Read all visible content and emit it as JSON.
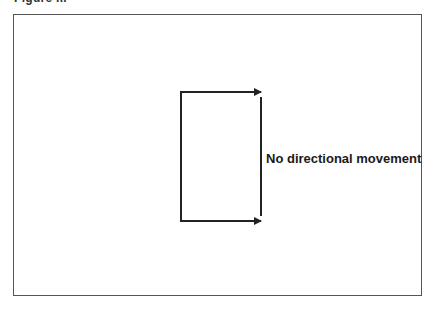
{
  "figure": {
    "caption_partial": "Figure ..."
  },
  "diagram": {
    "label": "No directional movement",
    "stroke_color": "#222222",
    "frame_color": "#555555",
    "shapes": [
      {
        "type": "line",
        "from": [
          181,
          92
        ],
        "to": [
          181,
          221
        ],
        "description": "left vertical segment"
      },
      {
        "type": "arrow",
        "from": [
          181,
          92
        ],
        "to": [
          261,
          92
        ],
        "description": "top arrow pointing right"
      },
      {
        "type": "arrow",
        "from": [
          181,
          221
        ],
        "to": [
          261,
          221
        ],
        "description": "bottom arrow pointing right"
      },
      {
        "type": "line",
        "from": [
          261,
          97
        ],
        "to": [
          261,
          216
        ],
        "description": "right vertical segment"
      }
    ]
  }
}
